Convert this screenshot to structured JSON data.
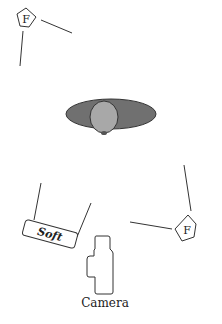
{
  "diagram": {
    "type": "lighting-setup",
    "colors": {
      "line": "#333333",
      "shoulders": "#707070",
      "head": "#a8a8a8",
      "background": "#ffffff"
    },
    "fill_light_top": {
      "label": "F"
    },
    "fill_light_right": {
      "label": "F"
    },
    "softbox": {
      "label": "Soft"
    },
    "subject": {
      "label": ""
    },
    "camera": {
      "label": "Camera"
    }
  }
}
